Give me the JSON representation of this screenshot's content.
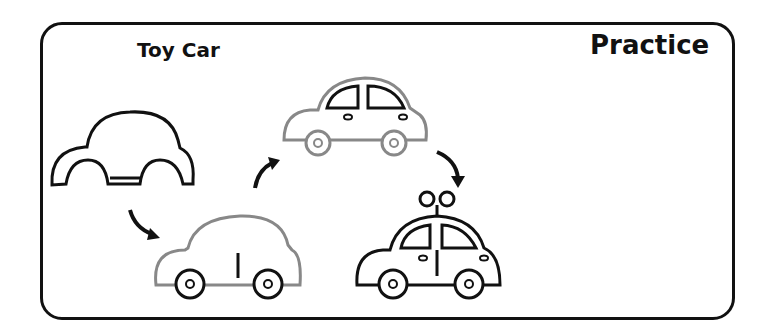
{
  "worksheet": {
    "title": "Toy Car",
    "label": "Practice",
    "steps": [
      {
        "step": 1,
        "description": "car body outline with wheel arches"
      },
      {
        "step": 2,
        "description": "add wheels and door line"
      },
      {
        "step": 3,
        "description": "add windows, lights and handles"
      },
      {
        "step": 4,
        "description": "add wind-up key on roof"
      }
    ],
    "colors": {
      "ink": "#111111",
      "guide": "#888888",
      "frame": "#111111"
    }
  }
}
